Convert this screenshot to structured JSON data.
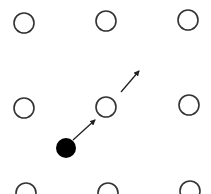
{
  "diagram": {
    "colors": {
      "stroke": "#333333",
      "fill_particle": "#000000",
      "background": "#ffffff"
    },
    "lattice_sites": [
      {
        "x": 24,
        "y": 23
      },
      {
        "x": 106,
        "y": 21
      },
      {
        "x": 188,
        "y": 20
      },
      {
        "x": 24,
        "y": 108
      },
      {
        "x": 106,
        "y": 107
      },
      {
        "x": 189,
        "y": 105
      },
      {
        "x": 26,
        "y": 193
      },
      {
        "x": 108,
        "y": 193
      },
      {
        "x": 190,
        "y": 191
      }
    ],
    "particle": {
      "x": 66,
      "y": 148,
      "r": 10
    },
    "arrows": [
      {
        "x1": 73,
        "y1": 140,
        "x2": 95,
        "y2": 120
      },
      {
        "x1": 121,
        "y1": 92,
        "x2": 139,
        "y2": 71
      }
    ]
  }
}
